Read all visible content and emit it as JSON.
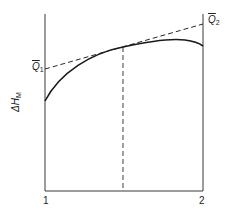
{
  "figure": {
    "y_axis_label": "ΔH",
    "y_axis_label_sub": "M",
    "x_tick_left": "1",
    "x_tick_right": "2",
    "q1_label": "Q",
    "q1_sub": "1",
    "q2_label": "Q",
    "q2_sub": "2",
    "colors": {
      "line": "#2a2a2a",
      "background": "#ffffff"
    }
  }
}
